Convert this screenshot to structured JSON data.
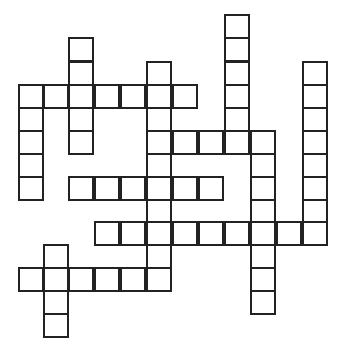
{
  "puzzle": {
    "type": "crossword",
    "colors": {
      "line": "#222222",
      "cell_fill": "#ffffff",
      "background": "#ffffff"
    },
    "grid": {
      "col_x": [
        19,
        44,
        69,
        95,
        121,
        147,
        173,
        199,
        225,
        251,
        277,
        303
      ],
      "row_y": [
        15,
        38,
        62,
        85,
        108,
        131,
        154,
        177,
        200,
        222,
        245,
        268,
        291,
        314
      ],
      "cell_w": 26,
      "cell_h": 25,
      "rows": [
        {
          "row": 0,
          "cols": [
            8
          ]
        },
        {
          "row": 1,
          "cols": [
            2,
            8
          ]
        },
        {
          "row": 2,
          "cols": [
            2,
            5,
            8,
            11
          ]
        },
        {
          "row": 3,
          "cols": [
            0,
            1,
            2,
            3,
            4,
            5,
            6,
            8,
            11
          ]
        },
        {
          "row": 4,
          "cols": [
            0,
            2,
            5,
            8,
            11
          ]
        },
        {
          "row": 5,
          "cols": [
            0,
            2,
            5,
            6,
            7,
            8,
            9,
            11
          ]
        },
        {
          "row": 6,
          "cols": [
            0,
            5,
            9,
            11
          ]
        },
        {
          "row": 7,
          "cols": [
            0,
            2,
            3,
            4,
            5,
            6,
            7,
            9,
            11
          ]
        },
        {
          "row": 8,
          "cols": [
            5,
            9,
            11
          ]
        },
        {
          "row": 9,
          "cols": [
            3,
            4,
            5,
            6,
            7,
            8,
            9,
            10,
            11
          ]
        },
        {
          "row": 10,
          "cols": [
            1,
            5,
            9
          ]
        },
        {
          "row": 11,
          "cols": [
            0,
            1,
            2,
            3,
            4,
            5,
            9
          ]
        },
        {
          "row": 12,
          "cols": [
            1,
            9
          ]
        },
        {
          "row": 13,
          "cols": [
            1
          ]
        }
      ]
    },
    "entries": []
  }
}
